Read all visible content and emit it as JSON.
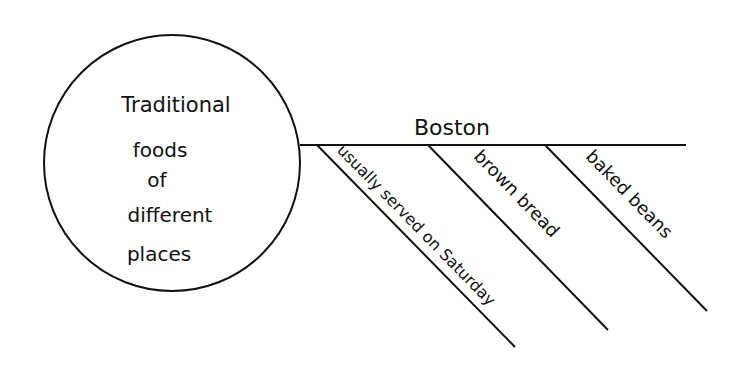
{
  "diagram": {
    "type": "organizer-web",
    "stroke_color": "#111111",
    "background": "#ffffff",
    "center": {
      "lines": [
        "Traditional",
        "foods",
        "of",
        "different",
        "places"
      ]
    },
    "branch": {
      "label": "Boston",
      "details": [
        {
          "label": "usually served on Saturday"
        },
        {
          "label": "brown bread"
        },
        {
          "label": "baked beans"
        }
      ]
    }
  }
}
